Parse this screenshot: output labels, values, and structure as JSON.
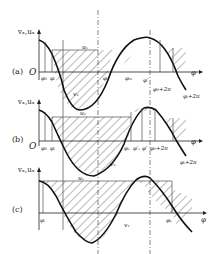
{
  "panels": [
    {
      "id": "a",
      "label": "(a)",
      "y_axis_label": "vₓ,uₓ",
      "origin": "O",
      "x_axis_label": "φ",
      "curve_labels": {
        "u": "uₓ",
        "v": "vₓ"
      },
      "tick_labels": [
        "φ₀",
        "φᵢ",
        "φₐ",
        "φₘ",
        "φ′",
        "φ₀+2π",
        "φᵢ+2π"
      ]
    },
    {
      "id": "b",
      "label": "(b)",
      "y_axis_label": "vₓ,uₓ",
      "origin": "O",
      "x_axis_label": "φ",
      "curve_labels": {
        "u": "uₓ",
        "v": "vₓ"
      },
      "tick_labels": [
        "φ₀",
        "φᵢ",
        "φₓ",
        "φ′ₓ",
        "φ′",
        "φ₀+2π",
        "φᵢ+2π"
      ]
    },
    {
      "id": "c",
      "label": "(c)",
      "y_axis_label": "vₓ,uₓ",
      "origin": "",
      "x_axis_label": "φ",
      "curve_labels": {
        "u": "uₓ",
        "v": "vₓ"
      },
      "tick_labels": [
        "φᵢ",
        "φₛ"
      ]
    }
  ]
}
